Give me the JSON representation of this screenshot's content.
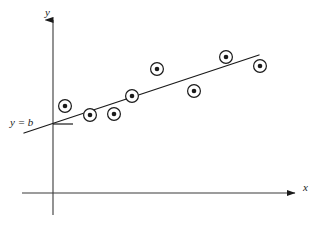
{
  "figure": {
    "background_color": "#ffffff",
    "stroke_color": "#1a1a1a",
    "width": 320,
    "height": 231
  },
  "axes": {
    "x_label": "x",
    "y_label": "y",
    "origin": {
      "x": 53,
      "y": 193
    },
    "x_axis": {
      "x1": 22,
      "y1": 193,
      "x2": 295,
      "y2": 193,
      "arrow": "right"
    },
    "y_axis": {
      "x1": 53,
      "y1": 215,
      "x2": 53,
      "y2": 20,
      "arrow": "up"
    },
    "x_label_pos": {
      "x": 303,
      "y": 191
    },
    "y_label_pos": {
      "x": 45,
      "y": 16
    }
  },
  "intercept": {
    "label": "y = b",
    "label_pos": {
      "x": 10,
      "y": 126
    },
    "tick": {
      "x1": 53,
      "y1": 124,
      "x2": 73,
      "y2": 124
    }
  },
  "chart_data": {
    "type": "scatter",
    "title": "",
    "xlabel": "x",
    "ylabel": "y",
    "grid": false,
    "legend": null,
    "annotations": [
      {
        "text": "y = b",
        "x": 10,
        "y": 126
      }
    ],
    "marker_style": "circle-with-center-dot",
    "points": [
      {
        "x": 65,
        "y": 106
      },
      {
        "x": 90,
        "y": 115
      },
      {
        "x": 114,
        "y": 114
      },
      {
        "x": 132,
        "y": 96
      },
      {
        "x": 157,
        "y": 69
      },
      {
        "x": 194,
        "y": 91
      },
      {
        "x": 226,
        "y": 57
      },
      {
        "x": 260,
        "y": 66
      }
    ],
    "fit_line": {
      "name": "least squares line",
      "x1": 24,
      "y1": 133,
      "x2": 259,
      "y2": 55
    }
  }
}
